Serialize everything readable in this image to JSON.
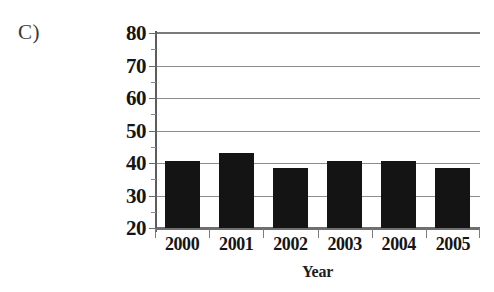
{
  "panel": {
    "label": "C)"
  },
  "chart_data": {
    "type": "bar",
    "title": "",
    "xlabel": "Year",
    "ylabel": "Percent Growth",
    "categories": [
      "2000",
      "2001",
      "2002",
      "2003",
      "2004",
      "2005"
    ],
    "values": [
      40.5,
      43,
      38.5,
      40.5,
      40.5,
      38.5
    ],
    "ylim": [
      20,
      80
    ],
    "yticks": [
      20,
      30,
      40,
      50,
      60,
      70,
      80
    ],
    "ytick_labels": [
      "20",
      "30",
      "40",
      "50",
      "60",
      "70",
      "80"
    ],
    "grid": true,
    "grid_axis": "y",
    "legend": null,
    "bar_color": "#141414",
    "gridline_color": "#8d8d8d",
    "axis_color": "#6f6f6f",
    "background": "#ffffff"
  }
}
